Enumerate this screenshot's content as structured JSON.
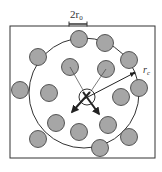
{
  "diagram": {
    "labels": {
      "diameter": "2r",
      "diameter_sub": "0",
      "cutoff": "r",
      "cutoff_sub": "c"
    },
    "colors": {
      "particle_fill": "#a6a6a6",
      "stroke": "#333333",
      "background": "#ffffff"
    },
    "box": {
      "x": 10,
      "y": 26,
      "width": 145,
      "height": 132
    },
    "cutoff_circle": {
      "cx": 84,
      "cy": 93,
      "r": 55
    },
    "central_particle": {
      "cx": 87,
      "cy": 97,
      "r": 8
    },
    "particle_radius": 8.5,
    "particles": [
      {
        "cx": 79,
        "cy": 39
      },
      {
        "cx": 105,
        "cy": 43
      },
      {
        "cx": 38,
        "cy": 57
      },
      {
        "cx": 129,
        "cy": 60
      },
      {
        "cx": 70,
        "cy": 67
      },
      {
        "cx": 106,
        "cy": 69
      },
      {
        "cx": 20,
        "cy": 90
      },
      {
        "cx": 49,
        "cy": 93
      },
      {
        "cx": 139,
        "cy": 88
      },
      {
        "cx": 121,
        "cy": 97
      },
      {
        "cx": 56,
        "cy": 123
      },
      {
        "cx": 79,
        "cy": 132
      },
      {
        "cx": 108,
        "cy": 125
      },
      {
        "cx": 38,
        "cy": 139
      },
      {
        "cx": 129,
        "cy": 137
      },
      {
        "cx": 100,
        "cy": 148
      }
    ]
  }
}
